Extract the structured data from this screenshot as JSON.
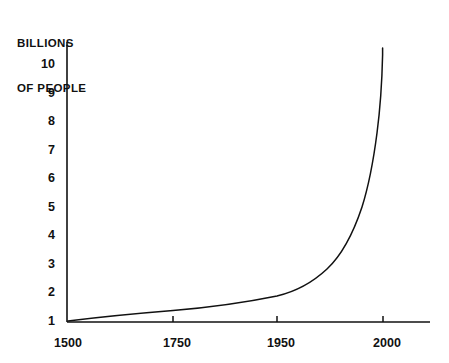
{
  "chart_data": {
    "type": "line",
    "title": "BILLIONS OF PEOPLE",
    "title_line1": "BILLIONS",
    "title_line2": "OF PEOPLE",
    "xlabel": "",
    "ylabel": "BILLIONS OF PEOPLE",
    "grid": false,
    "legend": null,
    "line_color": "#111111",
    "background_color": "#ffffff",
    "axis_color": "#111111",
    "xtick_labels": [
      "1500",
      "1750",
      "1950",
      "2000"
    ],
    "xtick_values": [
      1500,
      1750,
      1950,
      2000
    ],
    "ytick_labels": [
      "1",
      "2",
      "3",
      "4",
      "5",
      "6",
      "7",
      "8",
      "9",
      "10"
    ],
    "ytick_values": [
      1,
      2,
      3,
      4,
      5,
      6,
      7,
      8,
      9,
      10
    ],
    "ylim": [
      1,
      10.4
    ],
    "xlim": [
      1500,
      2020
    ],
    "x_axis_scale": "compressed-nonlinear",
    "series": [
      {
        "name": "World population",
        "x": [
          1500,
          1550,
          1600,
          1650,
          1700,
          1750,
          1800,
          1850,
          1900,
          1925,
          1950,
          1960,
          1970,
          1975,
          1980,
          1985,
          1990,
          1995,
          2000
        ],
        "values": [
          1.0,
          1.05,
          1.12,
          1.18,
          1.25,
          1.35,
          1.45,
          1.55,
          1.68,
          1.78,
          1.9,
          2.3,
          2.9,
          3.3,
          3.9,
          4.6,
          5.6,
          7.2,
          10.3
        ]
      }
    ]
  },
  "chart_geometry": {
    "x_axis_pixel_left": 67,
    "x_axis_pixel_right": 430,
    "y_axis_pixel_top": 42,
    "y_axis_pixel_bottom": 322,
    "ytick_pixels": [
      321,
      292.5,
      264,
      235.5,
      207,
      178.5,
      150,
      121.5,
      93,
      64.5
    ],
    "xtick_pixels": [
      68,
      173,
      277,
      383
    ],
    "curve_path": "M 68,321 C 100,317 136,313.5 173,310.5 C 210,307.5 245,302.5 277,296 C 296,291.5 312,283 327,269 C 342,255 353,234 362,207 C 368,188 373,164 377,133 C 380,110 382,82 382.6,55 L 382.6,48"
  }
}
